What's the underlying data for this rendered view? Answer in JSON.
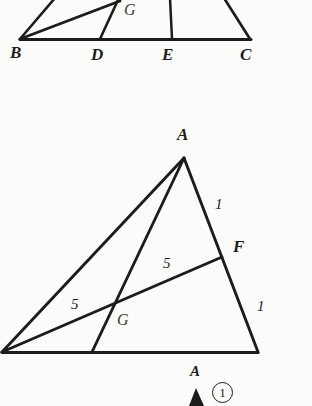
{
  "figure": {
    "type": "geometry-diagram",
    "ink_color": "#1c1c1c",
    "paper_color": "#fbfbfa"
  },
  "diagram_top": {
    "name": "partial-triangle-BDEC",
    "labels": {
      "B": "B",
      "D": "D",
      "E": "E",
      "C": "C",
      "G": "G"
    }
  },
  "diagram_main": {
    "name": "triangle-ABC-with-cevians",
    "labels": {
      "A": "A",
      "F": "F",
      "G": "G"
    },
    "segment_labels": {
      "AF": "1",
      "FC": "1",
      "GF": "5",
      "BG": "5"
    }
  },
  "diagram_bottom": {
    "name": "partial-figure-A",
    "labels": {
      "A": "A",
      "marker": "1"
    }
  }
}
